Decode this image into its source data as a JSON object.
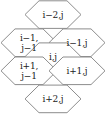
{
  "figure": {
    "kind": "hexagonal-grid-neighborhood-diagram",
    "stroke_color": "#8d8d8d",
    "fill_color": "#ffffff",
    "text_color": "#1b1b1b",
    "background": "#ffffff"
  },
  "cells": {
    "top": {
      "name": "top-neighbor",
      "label": "i−2,j",
      "line1": "i−2,j",
      "line2": ""
    },
    "upper_left": {
      "name": "upper-left-neighbor",
      "label": "i−1, j−1",
      "line1": "i−1,",
      "line2": "j−1"
    },
    "upper_right": {
      "name": "upper-right-neighbor",
      "label": "i−1,j",
      "line1": "i−1,j",
      "line2": ""
    },
    "center": {
      "name": "center-cell",
      "label": "i,j",
      "line1": "i,j",
      "line2": ""
    },
    "lower_left": {
      "name": "lower-left-neighbor",
      "label": "i+1, j−1",
      "line1": "i+1,",
      "line2": "j−1"
    },
    "lower_right": {
      "name": "lower-right-neighbor",
      "label": "i+1,j",
      "line1": "i+1,j",
      "line2": ""
    },
    "bottom": {
      "name": "bottom-neighbor",
      "label": "i+2,j",
      "line1": "i+2,j",
      "line2": ""
    }
  }
}
